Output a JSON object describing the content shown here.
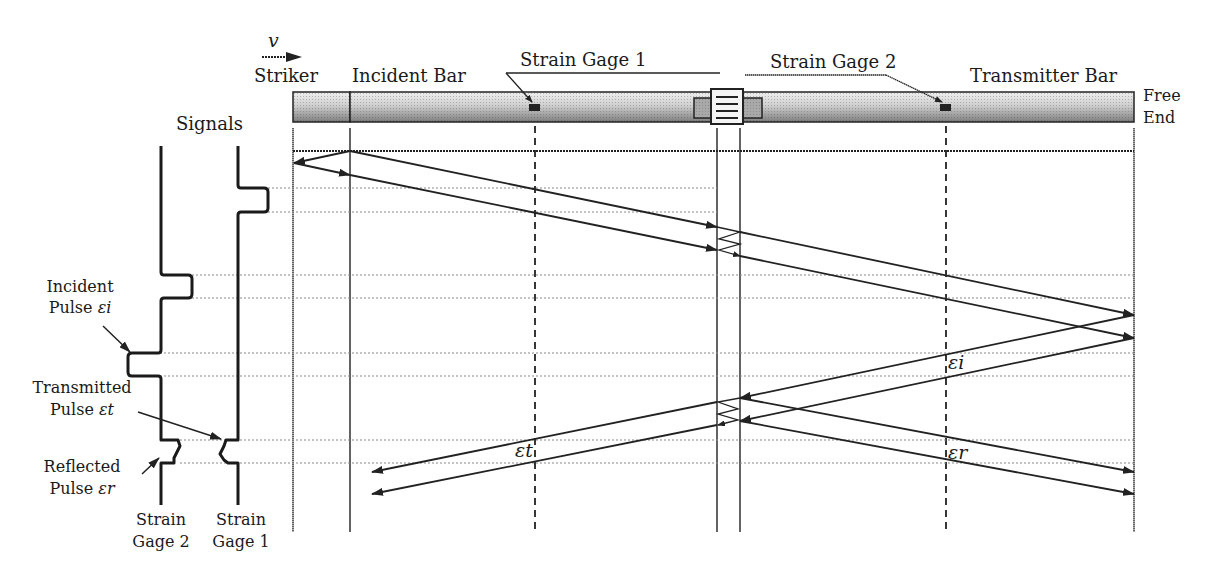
{
  "labels": {
    "velocity": "v",
    "striker": "Striker",
    "incident_bar": "Incident Bar",
    "strain_gage_1": "Strain Gage 1",
    "strain_gage_2": "Strain Gage 2",
    "transmitter_bar": "Transmitter Bar",
    "free_end_1": "Free",
    "free_end_2": "End",
    "signals": "Signals",
    "incident_pulse_1": "Incident",
    "incident_pulse_2": "Pulse ",
    "incident_symbol": "εi",
    "transmitted_pulse_1": "Transmitted",
    "transmitted_pulse_2": "Pulse ",
    "transmitted_symbol": "εt",
    "reflected_pulse_1": "Reflected",
    "reflected_pulse_2": "Pulse ",
    "reflected_symbol": "εr",
    "gage2_bottom_1": "Strain",
    "gage2_bottom_2": "Gage 2",
    "gage1_bottom_1": "Strain",
    "gage1_bottom_2": "Gage 1",
    "lattice_eps_i": "εi",
    "lattice_eps_t": "εt",
    "lattice_eps_r": "εr"
  },
  "colors": {
    "line": "#222222",
    "bar_light": "#e6e6e6",
    "bar_dark": "#8a8a8a",
    "dotted": "#9a9a9a"
  },
  "signals": {
    "gage_2": [
      "flat",
      "incident bump (left)",
      "reflected small bump (right)"
    ],
    "gage_1": [
      "flat",
      "early bump (right)",
      "transmitted small dent (left)"
    ]
  }
}
